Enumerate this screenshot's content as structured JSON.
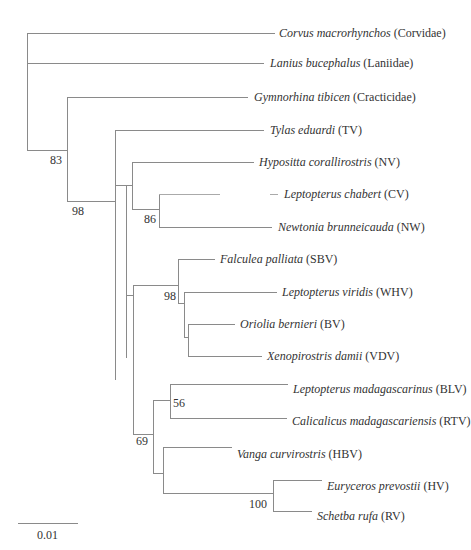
{
  "tree": {
    "taxa": [
      {
        "id": "corvus",
        "genus_species": "Corvus macrorhynchos",
        "group": "(Corvidae)",
        "x": 279,
        "y": 33
      },
      {
        "id": "lanius",
        "genus_species": "Lanius bucephalus",
        "group": "(Laniidae)",
        "x": 270,
        "y": 63
      },
      {
        "id": "gymnorhina",
        "genus_species": "Gymnorhina tibicen",
        "group": "(Cracticidae)",
        "x": 254,
        "y": 97
      },
      {
        "id": "tylas",
        "genus_species": "Tylas eduardi",
        "group": "(TV)",
        "x": 270,
        "y": 130
      },
      {
        "id": "hypositta",
        "genus_species": "Hypositta corallirostris",
        "group": "(NV)",
        "x": 259,
        "y": 162
      },
      {
        "id": "leptopterus-chabert",
        "genus_species": "Leptopterus chabert",
        "group": "(CV)",
        "x": 284,
        "y": 194
      },
      {
        "id": "newtonia",
        "genus_species": "Newtonia brunneicauda",
        "group": "(NW)",
        "x": 278,
        "y": 227
      },
      {
        "id": "falculea",
        "genus_species": "Falculea palliata",
        "group": "(SBV)",
        "x": 220,
        "y": 259
      },
      {
        "id": "leptopterus-viridis",
        "genus_species": "Leptopterus viridis",
        "group": "(WHV)",
        "x": 282,
        "y": 292
      },
      {
        "id": "oriolia",
        "genus_species": "Oriolia bernieri",
        "group": "(BV)",
        "x": 240,
        "y": 324
      },
      {
        "id": "xenopirostris",
        "genus_species": "Xenopirostris damii",
        "group": "(VDV)",
        "x": 267,
        "y": 356
      },
      {
        "id": "leptopterus-madagascarinus",
        "genus_species": "Leptopterus madagascarinus",
        "group": "(BLV)",
        "x": 293,
        "y": 389
      },
      {
        "id": "calicalicus",
        "genus_species": "Calicalicus madagascariensis",
        "group": "(RTV)",
        "x": 292,
        "y": 421
      },
      {
        "id": "vanga",
        "genus_species": "Vanga curvirostris",
        "group": "(HBV)",
        "x": 237,
        "y": 454
      },
      {
        "id": "euryceros",
        "genus_species": "Euryceros prevostii",
        "group": "(HV)",
        "x": 327,
        "y": 486
      },
      {
        "id": "schetba",
        "genus_species": "Schetba rufa",
        "group": "(RV)",
        "x": 317,
        "y": 516
      }
    ],
    "support_values": [
      {
        "node": "node-83",
        "value": "83",
        "x": 50,
        "y": 154
      },
      {
        "node": "node-98a",
        "value": "98",
        "x": 72,
        "y": 205
      },
      {
        "node": "node-86",
        "value": "86",
        "x": 144,
        "y": 213
      },
      {
        "node": "node-98b",
        "value": "98",
        "x": 164,
        "y": 290
      },
      {
        "node": "node-56",
        "value": "56",
        "x": 173,
        "y": 397
      },
      {
        "node": "node-69",
        "value": "69",
        "x": 136,
        "y": 435
      },
      {
        "node": "node-100",
        "value": "100",
        "x": 249,
        "y": 498
      }
    ],
    "scale_bar": {
      "label": "0.01",
      "x1": 18,
      "x2": 78,
      "y": 523
    }
  }
}
